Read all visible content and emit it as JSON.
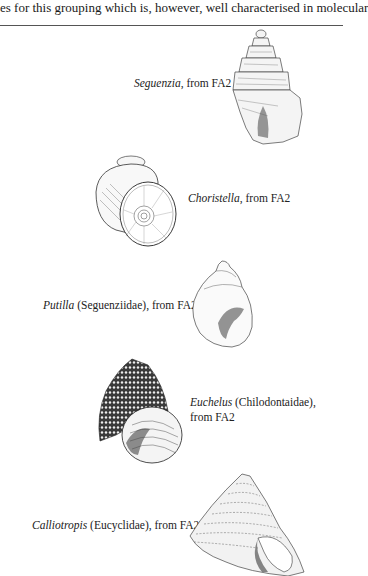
{
  "page": {
    "top_text": "es for this grouping which is, however, well characterised in molecular"
  },
  "figures": [
    {
      "genus": "Seguenzia",
      "rest": ", from FA2"
    },
    {
      "genus": "Choristella",
      "rest": ", from FA2"
    },
    {
      "genus": "Putilla",
      "rest": " (Seguenziidae), from FA2"
    },
    {
      "genus": "Euchelus",
      "rest": " (Chilodontaidae), from FA2"
    },
    {
      "genus": "Calliotropis",
      "rest": " (Eucyclidae), from FA2"
    }
  ]
}
